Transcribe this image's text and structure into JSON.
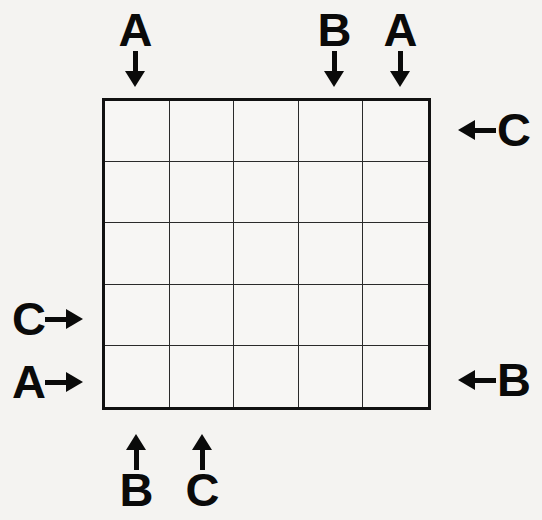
{
  "puzzle": {
    "type": "easy-as-abc-grid",
    "grid": {
      "rows": 5,
      "columns": 5,
      "cells": [
        [
          "",
          "",
          "",
          "",
          ""
        ],
        [
          "",
          "",
          "",
          "",
          ""
        ],
        [
          "",
          "",
          "",
          "",
          ""
        ],
        [
          "",
          "",
          "",
          "",
          ""
        ],
        [
          "",
          "",
          "",
          "",
          ""
        ]
      ]
    },
    "colors": {
      "background": "#f4f3f1",
      "grid_line": "#2a2a2a",
      "grid_border": "#111111",
      "ink": "#0a0a0a"
    },
    "clues": {
      "top": [
        {
          "letter": "A",
          "column": 1,
          "arrow": "down-arrow-icon"
        },
        {
          "letter": "B",
          "column": 4,
          "arrow": "down-arrow-icon"
        },
        {
          "letter": "A",
          "column": 5,
          "arrow": "down-arrow-icon"
        }
      ],
      "right": [
        {
          "letter": "C",
          "row": 1,
          "arrow": "left-arrow-icon"
        },
        {
          "letter": "B",
          "row": 5,
          "arrow": "left-arrow-icon"
        }
      ],
      "bottom": [
        {
          "letter": "B",
          "column": 1,
          "arrow": "up-arrow-icon"
        },
        {
          "letter": "C",
          "column": 2,
          "arrow": "up-arrow-icon"
        }
      ],
      "left": [
        {
          "letter": "C",
          "row": 4,
          "arrow": "right-arrow-icon"
        },
        {
          "letter": "A",
          "row": 5,
          "arrow": "right-arrow-icon"
        }
      ]
    }
  }
}
